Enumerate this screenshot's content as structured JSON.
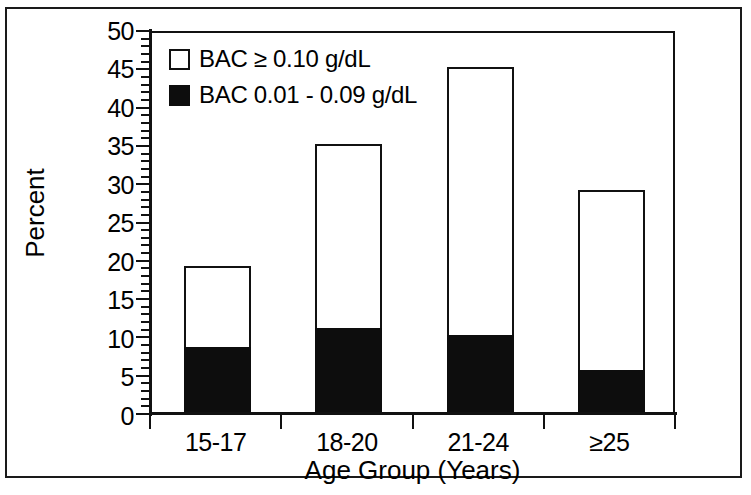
{
  "chart_data": {
    "type": "bar",
    "stacked": true,
    "title": "",
    "xlabel": "Age Group (Years)",
    "ylabel": "Percent",
    "categories": [
      "15-17",
      "18-20",
      "21-24",
      "≥25"
    ],
    "series": [
      {
        "name": "BAC 0.01 - 0.09 g/dL",
        "swatch": "filled",
        "color": "#0d0d0d",
        "values": [
          8.5,
          11,
          10,
          5.5
        ]
      },
      {
        "name": "BAC ≥ 0.10 g/dL",
        "swatch": "hollow",
        "color": "#ffffff",
        "values": [
          10.5,
          24,
          35,
          23.5
        ]
      }
    ],
    "totals": [
      19,
      35,
      45,
      29
    ],
    "ylim": [
      0,
      50
    ],
    "ytick_major": [
      0,
      5,
      10,
      15,
      20,
      25,
      30,
      35,
      40,
      45,
      50
    ],
    "ytick_minor_step": 1,
    "ytick_labels": [
      "0",
      "5",
      "10",
      "15",
      "20",
      "25",
      "30",
      "35",
      "40",
      "45",
      "50"
    ],
    "grid": false,
    "legend_position": "top-left",
    "legend_entries": [
      {
        "swatch": "hollow",
        "label": "BAC ≥ 0.10 g/dL"
      },
      {
        "swatch": "filled",
        "label": "BAC 0.01 - 0.09 g/dL"
      }
    ]
  },
  "axes": {
    "y_title": "Percent",
    "x_title": "Age Group (Years)"
  }
}
